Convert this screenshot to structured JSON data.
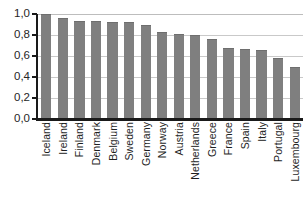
{
  "chart_data": {
    "type": "bar",
    "title": "",
    "subtitle": "",
    "xlabel": "",
    "ylabel": "",
    "ylim": [
      0.0,
      1.0
    ],
    "grid": true,
    "legend": false,
    "legend_position": "none",
    "orientation": "vertical",
    "bar_color": "#7f7f7f",
    "decimal_separator": ",",
    "ytick_labels": [
      "1,0",
      "0,8",
      "0,6",
      "0,4",
      "0,2",
      "0,0"
    ],
    "ytick_values": [
      1.0,
      0.8,
      0.6,
      0.4,
      0.2,
      0.0
    ],
    "categories": [
      "Iceland",
      "Ireland",
      "Finland",
      "Denmark",
      "Belgium",
      "Sweden",
      "Germany",
      "Norway",
      "Austria",
      "Netherlands",
      "Greece",
      "France",
      "Spain",
      "Italy",
      "Portugal",
      "Luxembourg"
    ],
    "values": [
      1.0,
      0.96,
      0.93,
      0.93,
      0.92,
      0.92,
      0.9,
      0.83,
      0.81,
      0.8,
      0.76,
      0.68,
      0.67,
      0.66,
      0.58,
      0.5
    ],
    "series": [
      {
        "name": "",
        "values": [
          1.0,
          0.96,
          0.93,
          0.93,
          0.92,
          0.92,
          0.9,
          0.83,
          0.81,
          0.8,
          0.76,
          0.68,
          0.67,
          0.66,
          0.58,
          0.5
        ]
      }
    ]
  }
}
